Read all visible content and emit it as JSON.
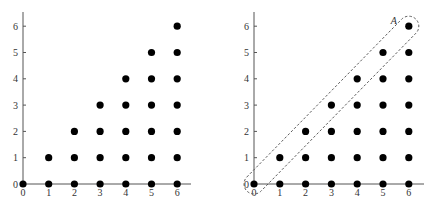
{
  "figure": {
    "panels": [
      {
        "id": "left",
        "origin_px": [
          23,
          184
        ],
        "x_step_px": 25.7,
        "y_step_px": 26.3,
        "x_axis_end_px": 191,
        "y_axis_top_px": 12,
        "x_ticks": [
          "0",
          "1",
          "2",
          "3",
          "4",
          "5",
          "6"
        ],
        "y_ticks": [
          "0",
          "1",
          "2",
          "3",
          "4",
          "5",
          "6"
        ],
        "highlight": null
      },
      {
        "id": "right",
        "origin_px": [
          254,
          184
        ],
        "x_step_px": 25.8,
        "y_step_px": 26.3,
        "x_axis_end_px": 424,
        "y_axis_top_px": 12,
        "x_ticks": [
          "0",
          "1",
          "2",
          "3",
          "4",
          "5",
          "6"
        ],
        "y_ticks": [
          "0",
          "1",
          "2",
          "3",
          "4",
          "5",
          "6"
        ],
        "highlight": {
          "label": "A",
          "from": [
            0,
            0
          ],
          "to": [
            6,
            6
          ],
          "style": "dashed-capsule"
        }
      }
    ]
  },
  "chart_data": {
    "type": "scatter",
    "title": "",
    "xlabel": "",
    "ylabel": "",
    "xlim": [
      0,
      6
    ],
    "ylim": [
      0,
      6
    ],
    "grid": false,
    "points": [
      [
        0,
        0
      ],
      [
        1,
        0
      ],
      [
        1,
        1
      ],
      [
        2,
        0
      ],
      [
        2,
        1
      ],
      [
        2,
        2
      ],
      [
        3,
        0
      ],
      [
        3,
        1
      ],
      [
        3,
        2
      ],
      [
        3,
        3
      ],
      [
        4,
        0
      ],
      [
        4,
        1
      ],
      [
        4,
        2
      ],
      [
        4,
        3
      ],
      [
        4,
        4
      ],
      [
        5,
        0
      ],
      [
        5,
        1
      ],
      [
        5,
        2
      ],
      [
        5,
        3
      ],
      [
        5,
        4
      ],
      [
        5,
        5
      ],
      [
        6,
        0
      ],
      [
        6,
        1
      ],
      [
        6,
        2
      ],
      [
        6,
        3
      ],
      [
        6,
        4
      ],
      [
        6,
        5
      ],
      [
        6,
        6
      ]
    ],
    "annotations": [
      {
        "text": "A",
        "encloses": [
          [
            0,
            0
          ],
          [
            1,
            1
          ],
          [
            2,
            2
          ],
          [
            3,
            3
          ],
          [
            4,
            4
          ],
          [
            5,
            5
          ],
          [
            6,
            6
          ]
        ],
        "panel": "right"
      }
    ]
  }
}
